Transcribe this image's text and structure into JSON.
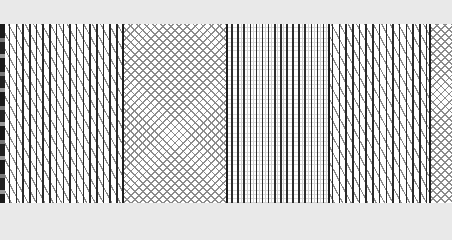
{
  "image": {
    "kind": "texture-pattern-swatches",
    "background_color": "#e9e9e9",
    "band": {
      "top": 24,
      "bottom": 203,
      "fill": "#ffffff"
    },
    "segments": [
      {
        "name": "dark-edge",
        "pattern": "noise",
        "x_start": 0,
        "x_end": 5,
        "color": "#1a1a1a"
      },
      {
        "name": "vertical-diagonal-hatch-1",
        "pattern": "vertical lines with steep diagonal hatching",
        "x_start": 5,
        "x_end": 123,
        "line_color": "#2a2a2a",
        "hatch_color": "#8a8a8a",
        "spacing_px": 6.7
      },
      {
        "name": "diamond-crosshatch-1",
        "pattern": "45-degree diamond crosshatch",
        "x_start": 123,
        "x_end": 227,
        "line_color": "#8c8c8c",
        "spacing_px": 8
      },
      {
        "name": "vertical-grid",
        "pattern": "vertical lines over faint grid",
        "x_start": 227,
        "x_end": 328,
        "line_color": "#2e2e2e",
        "grid_color": "#d8d8d8",
        "spacing_px": 6.1
      },
      {
        "name": "vertical-diagonal-hatch-2",
        "pattern": "vertical lines with steep diagonal hatching",
        "x_start": 328,
        "x_end": 430,
        "line_color": "#2a2a2a",
        "hatch_color": "#8a8a8a",
        "spacing_px": 6.7
      },
      {
        "name": "diamond-crosshatch-2",
        "pattern": "45-degree diamond crosshatch",
        "x_start": 430,
        "x_end": 452,
        "line_color": "#8c8c8c",
        "spacing_px": 8
      }
    ]
  }
}
